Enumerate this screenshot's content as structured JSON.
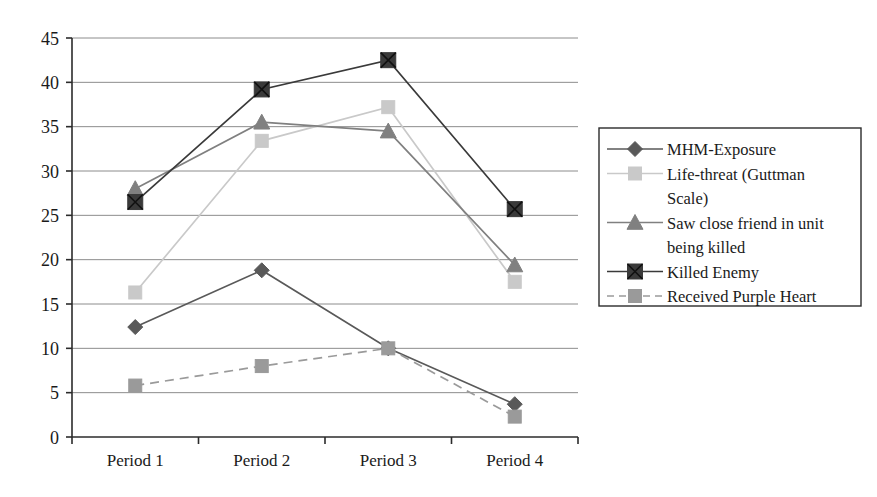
{
  "chart_data": {
    "type": "line",
    "title": "",
    "subtitle": "",
    "xlabel": "",
    "ylabel": "",
    "categories": [
      "Period 1",
      "Period 2",
      "Period 3",
      "Period 4"
    ],
    "ylim": [
      0,
      45
    ],
    "ytick_step": 5,
    "yticks": [
      "0",
      "5",
      "10",
      "15",
      "20",
      "25",
      "30",
      "35",
      "40",
      "45"
    ],
    "grid": true,
    "grid_axis": "y",
    "legend_position": "right",
    "series": [
      {
        "name": "MHM-Exposure",
        "values": [
          12.4,
          18.8,
          10.0,
          3.7
        ],
        "color": "#595959",
        "marker": "diamond",
        "dash": "solid"
      },
      {
        "name": "Life-threat (Guttman Scale)",
        "values": [
          16.3,
          33.4,
          37.2,
          17.5
        ],
        "color": "#c9c9c9",
        "marker": "square",
        "dash": "solid"
      },
      {
        "name": "Saw close friend in unit being killed",
        "values": [
          28.0,
          35.5,
          34.5,
          19.4
        ],
        "color": "#808080",
        "marker": "triangle",
        "dash": "solid"
      },
      {
        "name": "Killed Enemy",
        "values": [
          26.5,
          39.2,
          42.5,
          25.7
        ],
        "color": "#3a3a3a",
        "marker": "square-x",
        "dash": "solid"
      },
      {
        "name": "Received Purple Heart",
        "values": [
          5.8,
          8.0,
          10.0,
          2.3
        ],
        "color": "#9a9a9a",
        "marker": "square",
        "dash": "dashed"
      }
    ]
  },
  "legend": {
    "entries": [
      {
        "label": "MHM-Exposure"
      },
      {
        "label": "Life-threat (Guttman"
      },
      {
        "label": "Scale)"
      },
      {
        "label": "Saw close friend in unit"
      },
      {
        "label": "being killed"
      },
      {
        "label": "Killed Enemy"
      },
      {
        "label": "Received Purple Heart"
      }
    ]
  }
}
